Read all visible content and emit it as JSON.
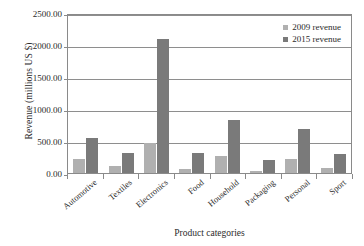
{
  "chart_data": {
    "type": "bar",
    "title": "",
    "xlabel": "Product categories",
    "ylabel": "Revenue (millions US $)",
    "categories": [
      "Automotive",
      "Textiles",
      "Electronics",
      "Food",
      "Household",
      "Packaging",
      "Personal",
      "Sport"
    ],
    "series": [
      {
        "name": "2009 revenue",
        "color": "#b0b0b0",
        "values": [
          220,
          110,
          470,
          65,
          270,
          35,
          225,
          85
        ]
      },
      {
        "name": "2015 revenue",
        "color": "#7a7a7a",
        "values": [
          545,
          320,
          2090,
          320,
          830,
          205,
          680,
          290
        ]
      }
    ],
    "ylim": [
      0,
      2500
    ],
    "ytick_values": [
      2500,
      2000,
      1500,
      1000,
      500,
      0
    ],
    "ytick_labels": [
      "2500.00",
      "2000.00",
      "1500.00",
      "1000.00",
      "500.00",
      "0.00"
    ],
    "grid": true,
    "grid_axis": "y",
    "legend_position": "top-right-inside",
    "legend": [
      "2009 revenue",
      "2015 revenue"
    ]
  },
  "colors": {
    "series_2009": "#b0b0b0",
    "series_2015": "#7a7a7a",
    "axis": "#8a8a8a",
    "text": "#2b2b2b",
    "background": "#ffffff"
  }
}
